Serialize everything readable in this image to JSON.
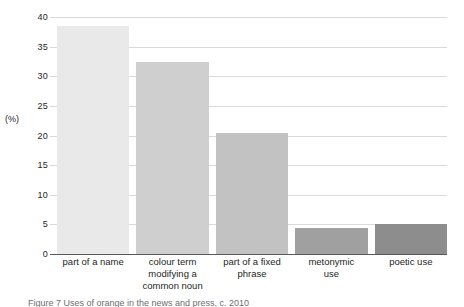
{
  "chart_data": {
    "type": "bar",
    "title": "",
    "xlabel": "",
    "ylabel": "(%)",
    "ylim": [
      0,
      40
    ],
    "yticks": [
      0,
      5,
      10,
      15,
      20,
      25,
      30,
      35,
      40
    ],
    "ytick_labels": [
      "0",
      "5",
      "10",
      "15",
      "20",
      "25",
      "30",
      "35",
      "40"
    ],
    "grid": true,
    "legend": "none",
    "categories": [
      "part of a name",
      "colour term modifying a common noun",
      "part of a fixed phrase",
      "metonymic use",
      "poetic use"
    ],
    "category_lines": [
      [
        "part of a name"
      ],
      [
        "colour term",
        "modifying a",
        "common noun"
      ],
      [
        "part of a fixed",
        "phrase"
      ],
      [
        "metonymic",
        "use"
      ],
      [
        "poetic use"
      ]
    ],
    "values": [
      38.5,
      32.4,
      20.4,
      4.4,
      5.1
    ],
    "bar_colors": [
      "#e9e9e9",
      "#cfcfcf",
      "#c2c2c2",
      "#a0a0a0",
      "#8d8d8d"
    ]
  },
  "axis": {
    "unit_label": "(%)"
  },
  "caption": {
    "text": "Figure 7  Uses of orange in the news and press, c. 2010"
  }
}
